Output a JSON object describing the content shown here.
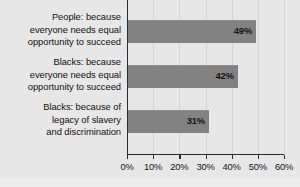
{
  "chart_data": {
    "type": "bar",
    "orientation": "horizontal",
    "title": "",
    "subtitle": "",
    "xlabel": "",
    "ylabel": "",
    "categories": [
      "People: because everyone needs equal opportunity to succeed",
      "Blacks: because everyone needs equal opportunity to succeed",
      "Blacks: because of legacy of slavery and discrimination"
    ],
    "category_lines": [
      [
        "People: because",
        "everyone needs equal",
        "opportunity to succeed"
      ],
      [
        "Blacks: because",
        "everyone needs equal",
        "opportunity to succeed"
      ],
      [
        "Blacks: because of",
        "legacy of slavery",
        "and discrimination"
      ]
    ],
    "values": [
      49,
      42,
      31
    ],
    "value_labels": [
      "49%",
      "42%",
      "31%"
    ],
    "xlim": [
      0,
      60
    ],
    "xticks": [
      0,
      10,
      20,
      30,
      40,
      50,
      60
    ],
    "xticklabels": [
      "0%",
      "10%",
      "20%",
      "30%",
      "40%",
      "50%",
      "60%"
    ],
    "grid": "vertical-only",
    "legend": "none",
    "bar_color": "#828282",
    "axis_color": "#2b2b2b",
    "gridline_color": "#d2d2d2",
    "background_color": "#e7e7e7",
    "text_color": "#111111"
  }
}
